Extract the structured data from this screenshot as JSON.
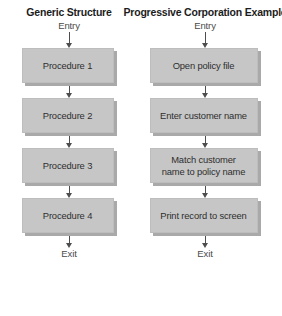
{
  "diagram": {
    "type": "flowchart",
    "orientation": "vertical",
    "columns": [
      {
        "id": "generic",
        "title": "Generic Structure",
        "entry_label": "Entry",
        "exit_label": "Exit",
        "nodes": [
          {
            "label": "Procedure 1"
          },
          {
            "label": "Procedure 2"
          },
          {
            "label": "Procedure 3"
          },
          {
            "label": "Procedure 4"
          }
        ]
      },
      {
        "id": "progressive",
        "title": "Progressive Corporation Example",
        "entry_label": "Entry",
        "exit_label": "Exit",
        "nodes": [
          {
            "label": "Open policy file"
          },
          {
            "label": "Enter customer name"
          },
          {
            "label": "Match customer\nname to policy name"
          },
          {
            "label": "Print record to screen"
          }
        ]
      }
    ],
    "colors": {
      "node_fill": "#c6c6c6",
      "node_shadow": "#a9a9a9",
      "arrow": "#4d4d4d",
      "title_text": "#1c1c1c",
      "node_text": "#2e2e2e",
      "terminal_text": "#4a4a4a",
      "background": "#ffffff"
    }
  }
}
